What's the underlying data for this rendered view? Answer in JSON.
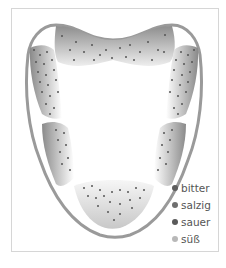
{
  "diagram": {
    "title": "",
    "regions": [
      {
        "id": "tip",
        "taste": "süß"
      },
      {
        "id": "front-sides",
        "taste": "salzig"
      },
      {
        "id": "back-sides",
        "taste": "sauer"
      },
      {
        "id": "back",
        "taste": "bitter"
      }
    ]
  },
  "legend": {
    "items": [
      {
        "label": "bitter",
        "color": "#5e5e5e"
      },
      {
        "label": "salzig",
        "color": "#6f6f6f"
      },
      {
        "label": "sauer",
        "color": "#5a5a5a"
      },
      {
        "label": "süß",
        "color": "#b8b8b8"
      }
    ]
  },
  "colors": {
    "outline": "#9a9a9a",
    "zone_dark": "#8c8c8c",
    "zone_light": "#ffffff",
    "dot": "#555555",
    "frame_border": "#d6d6d6"
  }
}
